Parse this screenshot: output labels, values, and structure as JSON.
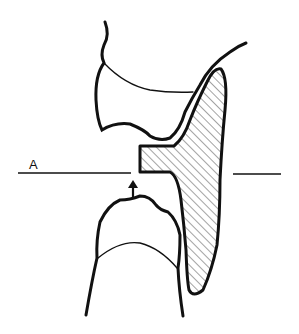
{
  "figure": {
    "type": "dental-occlusion-illustration",
    "labels": {
      "plane_label": "A"
    },
    "elements": [
      {
        "name": "upper-tooth",
        "description": "Upper tooth crown outline with gingival line"
      },
      {
        "name": "lower-tooth",
        "description": "Lower tooth crown outline with gingival line"
      },
      {
        "name": "appliance",
        "description": "Hatched appliance with horizontal occlusal stop"
      },
      {
        "name": "reference-line-A",
        "description": "Horizontal reference plane labeled A"
      },
      {
        "name": "up-arrow",
        "description": "Arrow indicating upward movement of lower tooth"
      }
    ],
    "colors": {
      "stroke": "#111111",
      "background": "#ffffff",
      "hatch": "#333333"
    }
  }
}
